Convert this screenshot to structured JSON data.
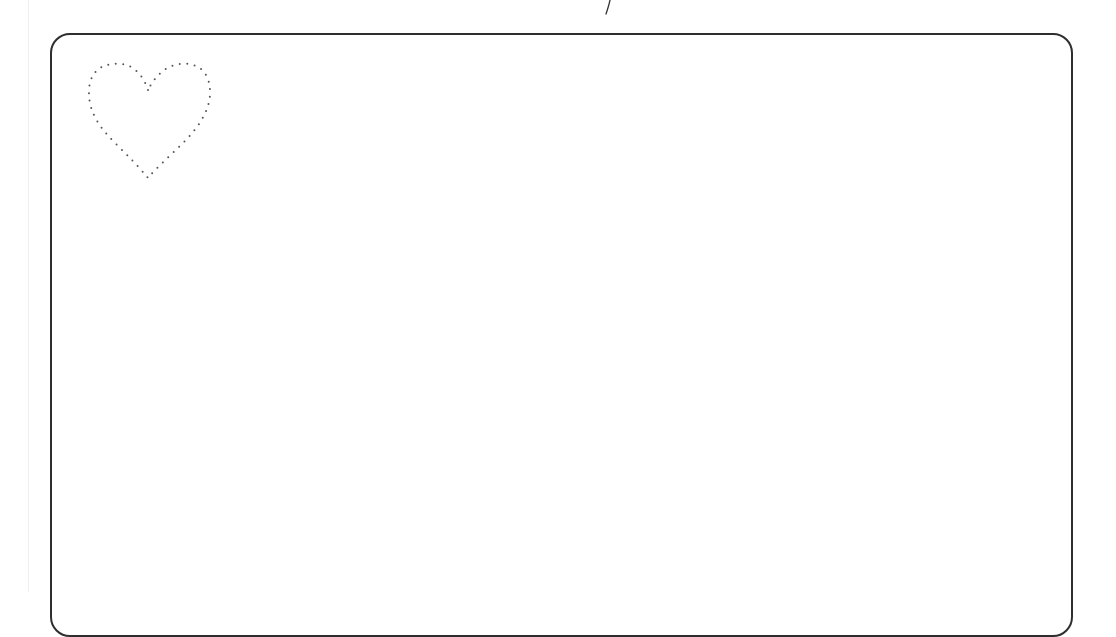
{
  "page": {
    "type": "tracing-worksheet",
    "background_color": "#ffffff",
    "frame": {
      "shape": "rounded-rectangle",
      "stroke_color": "#2e2e2e",
      "stroke_width": 2,
      "corner_radius": 20
    },
    "tracing_shape": {
      "name": "heart",
      "style": "dotted-outline",
      "dot_color": "#555555"
    },
    "pen_mark": {
      "name": "stray-pen-stroke",
      "color": "#333333"
    },
    "text": ""
  }
}
